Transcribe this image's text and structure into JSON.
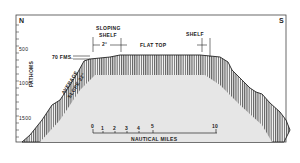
{
  "diagram": {
    "compass": {
      "left": "N",
      "right": "S"
    },
    "y_axis": {
      "label": "FATHOMS",
      "ticks": [
        "500",
        "1000",
        "1500"
      ]
    },
    "annotations": {
      "sloping_shelf": "SLOPING\nSHELF",
      "sloping_shelf_line1": "SLOPING",
      "sloping_shelf_line2": "SHELF",
      "shelf_angle": "2°",
      "flat_top": "FLAT TOP",
      "shelf": "SHELF",
      "depth_mark": "70 FMS.",
      "average_slope_line1": "AVERAGE",
      "average_slope_line2": "SLOPE 22°"
    },
    "scale_bar": {
      "label": "NAUTICAL MILES",
      "ticks": [
        "0",
        "1",
        "2",
        "3",
        "4",
        "5",
        "10"
      ]
    },
    "colors": {
      "line": "#222222",
      "fill": "#e6e6e6",
      "background": "#ffffff"
    }
  }
}
